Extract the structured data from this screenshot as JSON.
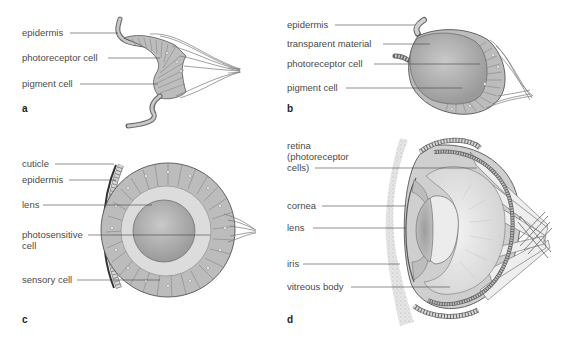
{
  "panels": [
    {
      "id": "a",
      "letter": "a",
      "description": "Pigment cup eye (flat/concave photoreceptor patch)",
      "labels": [
        "epidermis",
        "photoreceptor cell",
        "pigment cell"
      ]
    },
    {
      "id": "b",
      "letter": "b",
      "description": "Pinhole / cup eye filled with transparent material",
      "labels": [
        "epidermis",
        "transparent material",
        "photoreceptor cell",
        "pigment cell"
      ]
    },
    {
      "id": "c",
      "letter": "c",
      "description": "Closed vesicle eye with lens",
      "labels": [
        "cuticle",
        "epidermis",
        "lens",
        "photosensitive cell",
        "sensory cell"
      ]
    },
    {
      "id": "d",
      "letter": "d",
      "description": "Camera-type eye (cephalopod)",
      "labels": [
        "retina (photoreceptor cells)",
        "cornea",
        "lens",
        "iris",
        "vitreous body"
      ]
    }
  ],
  "colors": {
    "tissue": "#b8b8b8",
    "tissue_dark": "#8c8c8c",
    "lens": "#a9a9a9",
    "fluid": "#d9d9d9",
    "outline": "#555555",
    "leader": "#444444",
    "text": "#4a4a4a"
  }
}
